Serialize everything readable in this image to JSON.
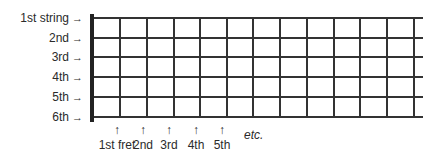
{
  "diagram": {
    "strings": [
      {
        "label": "1st string",
        "y": 18
      },
      {
        "label": "2nd",
        "y": 38
      },
      {
        "label": "3rd",
        "y": 57
      },
      {
        "label": "4th",
        "y": 77
      },
      {
        "label": "5th",
        "y": 97
      },
      {
        "label": "6th",
        "y": 117
      }
    ],
    "fret_positions_x": [
      120,
      147,
      174,
      200,
      227,
      253,
      280,
      307,
      334,
      360,
      387,
      414
    ],
    "fret_markers": [
      {
        "label": "1st fret",
        "x": 117
      },
      {
        "label": "2nd",
        "x": 143
      },
      {
        "label": "3rd",
        "x": 169
      },
      {
        "label": "4th",
        "x": 196
      },
      {
        "label": "5th",
        "x": 222
      }
    ],
    "arrow_right": "→",
    "arrow_up": "↑",
    "etc_label": "etc."
  }
}
